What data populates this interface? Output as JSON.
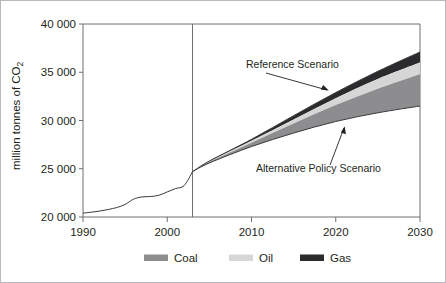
{
  "chart_data": {
    "type": "area",
    "title": "",
    "subtitle": "",
    "xlabel": "",
    "ylabel": "million tonnes of CO₂",
    "ylabel_parts": {
      "main": "million tonnes of CO",
      "sub": "2"
    },
    "xlim": [
      1990,
      2030
    ],
    "ylim": [
      20000,
      40000
    ],
    "grid": false,
    "legend_position": "bottom",
    "x_ticks": [
      1990,
      2000,
      2010,
      2020,
      2030
    ],
    "x_tick_labels": [
      "1990",
      "2000",
      "2010",
      "2020",
      "2030"
    ],
    "y_ticks": [
      20000,
      25000,
      30000,
      35000,
      40000
    ],
    "y_tick_labels": [
      "20 000",
      "25 000",
      "30 000",
      "35 000",
      "40 000"
    ],
    "projection_divider_year": 2003,
    "historical": {
      "name": "Historical emissions",
      "x": [
        1990,
        1991,
        1992,
        1993,
        1994,
        1995,
        1996,
        1997,
        1998,
        1999,
        2000,
        2001,
        2002,
        2003
      ],
      "y": [
        20400,
        20500,
        20620,
        20780,
        20980,
        21300,
        21850,
        22080,
        22120,
        22250,
        22600,
        22950,
        23250,
        24700
      ]
    },
    "series": [
      {
        "name": "Alternative Policy Scenario",
        "key": "alternative_total",
        "x": [
          2003,
          2005,
          2010,
          2015,
          2020,
          2025,
          2030
        ],
        "values": [
          24700,
          25600,
          27300,
          28700,
          29900,
          30800,
          31500
        ]
      },
      {
        "name": "Coal",
        "key": "coal_savings_top",
        "x": [
          2003,
          2005,
          2010,
          2015,
          2020,
          2025,
          2030
        ],
        "values": [
          24700,
          25700,
          27700,
          29700,
          31600,
          33300,
          34800
        ],
        "color": "#8d8d8f"
      },
      {
        "name": "Oil",
        "key": "oil_savings_top",
        "x": [
          2003,
          2005,
          2010,
          2015,
          2020,
          2025,
          2030
        ],
        "values": [
          24700,
          25750,
          27900,
          30100,
          32300,
          34300,
          36000
        ],
        "color": "#d6d6d6"
      },
      {
        "name": "Gas",
        "key": "gas_savings_top_reference",
        "x": [
          2003,
          2005,
          2010,
          2015,
          2020,
          2025,
          2030
        ],
        "values": [
          24700,
          25800,
          28050,
          30500,
          32900,
          35100,
          37100
        ],
        "color": "#2b2b2d"
      }
    ],
    "annotations": [
      {
        "text": "Reference Scenario",
        "x": 2016,
        "y": 36400
      },
      {
        "text": "Alternative Policy Scenario",
        "x": 2018,
        "y": 27700
      }
    ],
    "legend": [
      {
        "label": "Coal",
        "color": "#8d8d8f"
      },
      {
        "label": "Oil",
        "color": "#d6d6d6"
      },
      {
        "label": "Gas",
        "color": "#2b2b2d"
      }
    ]
  },
  "colors": {
    "coal": "#8d8d8f",
    "oil": "#d6d6d6",
    "gas": "#2b2b2d",
    "axis": "#6f6f72",
    "text": "#231f20",
    "background": "#ffffff",
    "frame": "#b9b9bb"
  }
}
